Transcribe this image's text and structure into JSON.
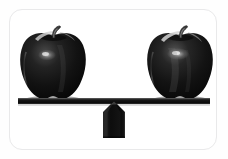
{
  "image": {
    "kind": "photo-illustration",
    "subject": "balance-scale-with-two-apples",
    "alt_text": "Two dark red apples of equal size resting on opposite ends of a level balance beam supported by a triangular fulcrum",
    "canvas": {
      "width": 228,
      "height": 159
    },
    "background_color": "#ffffff",
    "outer_color": "#fefefe"
  },
  "card": {
    "name": "rounded-photo-frame",
    "border_color": "#e9e9ea",
    "background_color": "#ffffff",
    "corner_radius_px": 13,
    "x": 9,
    "y": 9,
    "width": 208,
    "height": 141
  },
  "scene": {
    "state": "balanced",
    "objects": [
      {
        "name": "apple-left",
        "label": "apple",
        "side": "left",
        "color": "#151515",
        "highlight_color": "#8d8d8d",
        "stem_color": "#2b2b2b",
        "x": 19,
        "y": 27,
        "width": 68,
        "height": 73
      },
      {
        "name": "apple-right",
        "label": "apple",
        "side": "right",
        "color": "#151515",
        "highlight_color": "#9a9a9a",
        "stem_color": "#2b2b2b",
        "x": 146,
        "y": 27,
        "width": 68,
        "height": 73
      },
      {
        "name": "balance-beam",
        "label": "beam",
        "color": "#161616",
        "x": 18,
        "y": 98,
        "width": 192,
        "height": 6,
        "tilt_degrees": 0
      },
      {
        "name": "fulcrum",
        "label": "fulcrum",
        "shape": "pentagon-pointed-top",
        "color": "#141414",
        "x": 103,
        "y": 101,
        "width": 22,
        "height": 37
      }
    ]
  }
}
